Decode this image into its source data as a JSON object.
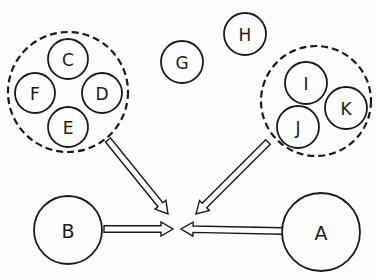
{
  "diagram": {
    "colors": {
      "stroke": "#1a1a1a",
      "background": "#fdfdfd",
      "arrow_fill": "#ffffff"
    },
    "groups": [
      {
        "id": "left-group",
        "style": "dashed",
        "cx": 68,
        "cy": 92,
        "r": 60,
        "members": [
          "C",
          "D",
          "E",
          "F"
        ]
      },
      {
        "id": "right-group",
        "style": "dashed",
        "cx": 316,
        "cy": 101,
        "r": 55,
        "members": [
          "I",
          "J",
          "K"
        ]
      }
    ],
    "nodes": [
      {
        "label": "C",
        "cx": 68,
        "cy": 59,
        "r": 20
      },
      {
        "label": "F",
        "cx": 35,
        "cy": 93,
        "r": 20
      },
      {
        "label": "D",
        "cx": 102,
        "cy": 93,
        "r": 20
      },
      {
        "label": "E",
        "cx": 68,
        "cy": 127,
        "r": 20
      },
      {
        "label": "G",
        "cx": 182,
        "cy": 62,
        "r": 21
      },
      {
        "label": "H",
        "cx": 245,
        "cy": 34,
        "r": 21
      },
      {
        "label": "I",
        "cx": 306,
        "cy": 83,
        "r": 21
      },
      {
        "label": "K",
        "cx": 346,
        "cy": 108,
        "r": 21
      },
      {
        "label": "J",
        "cx": 298,
        "cy": 127,
        "r": 21
      },
      {
        "label": "B",
        "cx": 68,
        "cy": 230,
        "r": 34
      },
      {
        "label": "A",
        "cx": 321,
        "cy": 232,
        "r": 39
      }
    ],
    "arrows": [
      {
        "from": "left-group",
        "to": "center",
        "x1": 108,
        "y1": 140,
        "x2": 168,
        "y2": 214
      },
      {
        "from": "right-group",
        "to": "center",
        "x1": 268,
        "y1": 142,
        "x2": 196,
        "y2": 214
      },
      {
        "from": "B",
        "to": "center",
        "x1": 104,
        "y1": 229,
        "x2": 173,
        "y2": 229
      },
      {
        "from": "A",
        "to": "center",
        "x1": 282,
        "y1": 231,
        "x2": 181,
        "y2": 229
      }
    ]
  }
}
